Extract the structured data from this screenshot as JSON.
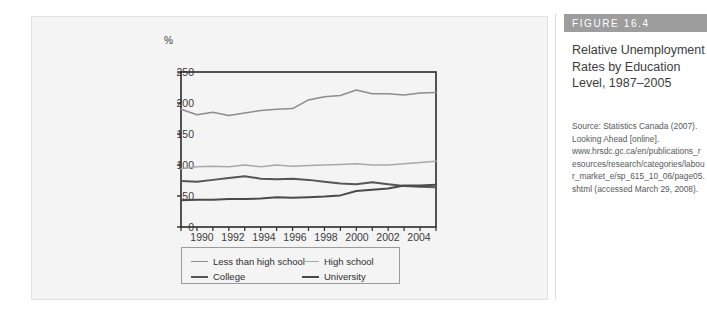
{
  "figure": {
    "badge": "FIGURE 16.4",
    "title": "Relative Unemployment Rates by Education Level, 1987–2005",
    "source": "Source: Statistics Canada (2007). Looking Ahead [online]. www.hrsdc.gc.ca/en/publications_resources/research/categories/labour_market_e/sp_615_10_06/page05.shtml (accessed March 29, 2008)."
  },
  "colors": {
    "less_than_high_school": "#8d8d8d",
    "high_school": "#a8a8a8",
    "college": "#565656",
    "university": "#4a4a4a",
    "axis": "#2b2b2b",
    "panel_background": "#f4f4f4",
    "badge_background": "#9d9d9d",
    "text": "#3b3b3b"
  },
  "chart_data": {
    "type": "line",
    "title": "Relative Unemployment Rates by Education Level, 1987–2005",
    "xlabel": "",
    "ylabel": "%",
    "ylim": [
      0,
      250
    ],
    "xlim": [
      1989,
      2005
    ],
    "yticks": [
      0,
      50,
      100,
      150,
      200,
      250
    ],
    "xticks_major": [
      1990,
      1992,
      1994,
      1996,
      1998,
      2000,
      2002,
      2004
    ],
    "xticks_all": [
      1989,
      1990,
      1991,
      1992,
      1993,
      1994,
      1995,
      1996,
      1997,
      1998,
      1999,
      2000,
      2001,
      2002,
      2003,
      2004,
      2005
    ],
    "grid": false,
    "legend_position": "below",
    "x": [
      1989,
      1990,
      1991,
      1992,
      1993,
      1994,
      1995,
      1996,
      1997,
      1998,
      1999,
      2000,
      2001,
      2002,
      2003,
      2004,
      2005
    ],
    "series": [
      {
        "name": "Less than high school",
        "color": "#8d8d8d",
        "values": [
          190,
          181,
          185,
          180,
          184,
          188,
          190,
          191,
          205,
          210,
          212,
          221,
          215,
          215,
          213,
          216,
          217
        ]
      },
      {
        "name": "High school",
        "color": "#a8a8a8",
        "values": [
          94,
          97,
          98,
          97,
          100,
          97,
          100,
          98,
          99,
          100,
          101,
          102,
          100,
          100,
          102,
          104,
          106
        ]
      },
      {
        "name": "College",
        "color": "#565656",
        "values": [
          74,
          73,
          76,
          79,
          82,
          78,
          77,
          78,
          76,
          73,
          70,
          69,
          72,
          69,
          66,
          65,
          64
        ]
      },
      {
        "name": "University",
        "color": "#4a4a4a",
        "values": [
          43,
          44,
          44,
          45,
          45,
          46,
          48,
          47,
          48,
          49,
          51,
          58,
          60,
          62,
          67,
          67,
          68
        ]
      }
    ]
  },
  "legend": {
    "items": [
      {
        "label": "Less than high school",
        "color": "#8d8d8d",
        "weight": "1.6px"
      },
      {
        "label": "High school",
        "color": "#a8a8a8",
        "weight": "1.6px"
      },
      {
        "label": "College",
        "color": "#565656",
        "weight": "2.2px"
      },
      {
        "label": "University",
        "color": "#4a4a4a",
        "weight": "2.2px"
      }
    ]
  },
  "axis": {
    "unit_label": "%",
    "y_labels": [
      "250",
      "200",
      "150",
      "100",
      "50",
      "0"
    ],
    "x_labels": [
      "1990",
      "1992",
      "1994",
      "1996",
      "1998",
      "2000",
      "2002",
      "2004"
    ]
  }
}
